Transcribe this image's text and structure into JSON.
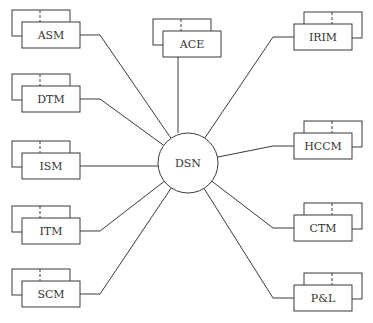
{
  "center": {
    "label": "DSN"
  },
  "modules": [
    {
      "id": "asm",
      "label": "ASM",
      "side": "left"
    },
    {
      "id": "dtm",
      "label": "DTM",
      "side": "left"
    },
    {
      "id": "ism",
      "label": "ISM",
      "side": "left"
    },
    {
      "id": "itm",
      "label": "ITM",
      "side": "left"
    },
    {
      "id": "scm",
      "label": "SCM",
      "side": "left"
    },
    {
      "id": "ace",
      "label": "ACE",
      "side": "top"
    },
    {
      "id": "irim",
      "label": "IRIM",
      "side": "right"
    },
    {
      "id": "hccm",
      "label": "HCCM",
      "side": "right"
    },
    {
      "id": "ctm",
      "label": "CTM",
      "side": "right"
    },
    {
      "id": "pl",
      "label": "P&L",
      "side": "right"
    }
  ],
  "colors": {
    "line": "#3a3a3a",
    "text": "#333333",
    "background": "#ffffff"
  }
}
